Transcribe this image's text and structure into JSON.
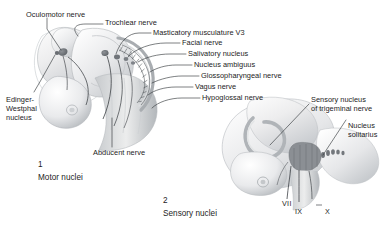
{
  "figure": {
    "background_color": "#ffffff",
    "text_color": "#1c1c1c",
    "line_color": "#333333",
    "art_tint": "#b9bcc0"
  },
  "panels": [
    {
      "number": "1",
      "caption": "Motor nuclei",
      "name": "motor-nuclei-panel"
    },
    {
      "number": "2",
      "caption": "Sensory nuclei",
      "name": "sensory-nuclei-panel"
    }
  ],
  "labels": {
    "oculomotor": "Oculomotor nerve",
    "trochlear": "Trochlear nerve",
    "masticatory": "Masticatory musculature V3",
    "facial": "Facial nerve",
    "salivatory": "Salivatory nucleus",
    "ambiguus": "Nucleus ambiguus",
    "glossopharyngeal": "Glossopharyngeal nerve",
    "vagus": "Vagus nerve",
    "hypoglossal": "Hypoglossal nerve",
    "edinger_westphal_line1": "Edinger-",
    "edinger_westphal_line2": "Westphal",
    "edinger_westphal_line3": "nucleus",
    "abducent": "Abducent nerve",
    "sensory_trigeminal_line1": "Sensory nucleus",
    "sensory_trigeminal_line2": "of trigeminal nerve",
    "nucleus_solitarius_line1": "Nucleus",
    "nucleus_solitarius_line2": "solitarius"
  },
  "nerve_numerals": {
    "seven": "VII",
    "nine": "IX",
    "ten": "X"
  }
}
